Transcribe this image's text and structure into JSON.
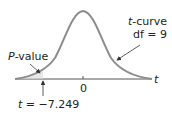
{
  "figure": {
    "type": "t-distribution density diagram",
    "curve_label_italic": "t",
    "curve_label_rest": "-curve",
    "df_label": "df = 9",
    "pvalue_label_italic": "P",
    "pvalue_label_rest": "-value",
    "axis_label": "t",
    "zero_label": "0",
    "t_stat_italic": "t",
    "t_stat_rest": " = −7.249",
    "colors": {
      "curve": "#8c8c8c",
      "axis": "#555555",
      "arrow": "#333333",
      "text": "#222222"
    }
  }
}
